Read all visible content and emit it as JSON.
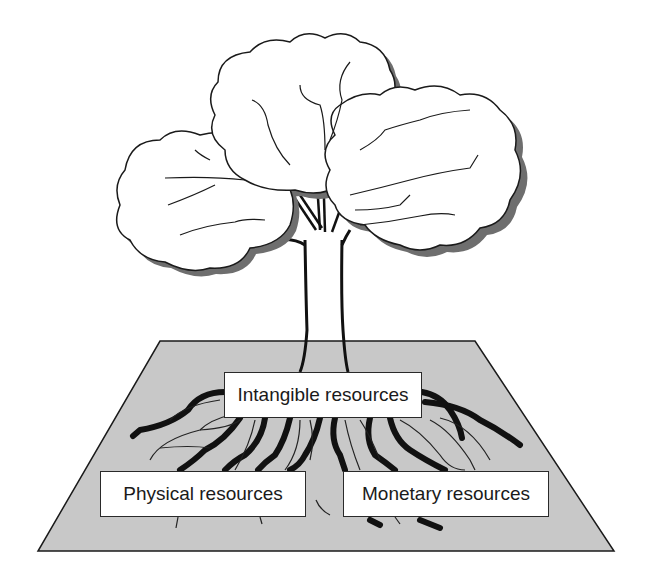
{
  "diagram": {
    "labels": {
      "intangible": "Intangible resources",
      "physical": "Physical resources",
      "monetary": "Monetary resources"
    },
    "colors": {
      "ground": "#c8c8c8",
      "outline": "#1a1a1a",
      "canopy_fill": "#ffffff",
      "canopy_shadow": "#6e6e6e",
      "background": "#ffffff"
    }
  }
}
